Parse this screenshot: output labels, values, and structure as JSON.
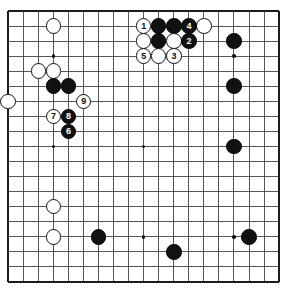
{
  "diagram": {
    "type": "go-board",
    "board_size": 19,
    "geometry": {
      "origin_x": 8.2,
      "origin_y": 11.0,
      "spacing": 15.05,
      "stone_diameter": 15.6,
      "hoshi_diameter": 3.6,
      "border_outer_width": 1.6,
      "line_width": 0.85
    },
    "colors": {
      "background": "#ffffff",
      "line": "#3a3a3a",
      "border": "#1b1b1b",
      "black_stone": "#111111",
      "white_stone": "#ffffff",
      "white_stone_edge": "#111111",
      "black_label": "#ffffff",
      "white_label": "#111111"
    },
    "hoshi_points": [
      [
        3,
        3
      ],
      [
        9,
        3
      ],
      [
        15,
        3
      ],
      [
        3,
        9
      ],
      [
        9,
        9
      ],
      [
        15,
        9
      ],
      [
        3,
        15
      ],
      [
        9,
        15
      ],
      [
        15,
        15
      ]
    ],
    "stones": [
      {
        "id": "w-c3-r1",
        "col": 3,
        "row": 1,
        "color": "white",
        "label": ""
      },
      {
        "id": "w-c2-r4",
        "col": 2,
        "row": 4,
        "color": "white",
        "label": ""
      },
      {
        "id": "w-c3-r4",
        "col": 3,
        "row": 4,
        "color": "white",
        "label": ""
      },
      {
        "id": "b-c3-r5",
        "col": 3,
        "row": 5,
        "color": "black",
        "label": ""
      },
      {
        "id": "b-c4-r5",
        "col": 4,
        "row": 5,
        "color": "black",
        "label": ""
      },
      {
        "id": "w-c0-r6",
        "col": 0,
        "row": 6,
        "color": "white",
        "label": ""
      },
      {
        "id": "w-c5-r6",
        "col": 5,
        "row": 6,
        "color": "white",
        "label": "9"
      },
      {
        "id": "w-c3-r7",
        "col": 3,
        "row": 7,
        "color": "white",
        "label": "7"
      },
      {
        "id": "b-c4-r7",
        "col": 4,
        "row": 7,
        "color": "black",
        "label": "8"
      },
      {
        "id": "b-c4-r8",
        "col": 4,
        "row": 8,
        "color": "black",
        "label": "6"
      },
      {
        "id": "w-c3-r13",
        "col": 3,
        "row": 13,
        "color": "white",
        "label": ""
      },
      {
        "id": "w-c3-r15",
        "col": 3,
        "row": 15,
        "color": "white",
        "label": ""
      },
      {
        "id": "b-c6-r15",
        "col": 6,
        "row": 15,
        "color": "black",
        "label": ""
      },
      {
        "id": "b-c11-r16",
        "col": 11,
        "row": 16,
        "color": "black",
        "label": ""
      },
      {
        "id": "b-c16-r15",
        "col": 16,
        "row": 15,
        "color": "black",
        "label": ""
      },
      {
        "id": "w-c9-r1",
        "col": 9,
        "row": 1,
        "color": "white",
        "label": "1"
      },
      {
        "id": "b-c10-r1",
        "col": 10,
        "row": 1,
        "color": "black",
        "label": ""
      },
      {
        "id": "b-c11-r1",
        "col": 11,
        "row": 1,
        "color": "black",
        "label": ""
      },
      {
        "id": "b-c12-r1",
        "col": 12,
        "row": 1,
        "color": "black",
        "label": "4"
      },
      {
        "id": "w-c13-r1",
        "col": 13,
        "row": 1,
        "color": "white",
        "label": ""
      },
      {
        "id": "w-c9-r2",
        "col": 9,
        "row": 2,
        "color": "white",
        "label": ""
      },
      {
        "id": "b-c10-r2",
        "col": 10,
        "row": 2,
        "color": "black",
        "label": ""
      },
      {
        "id": "w-c11-r2",
        "col": 11,
        "row": 2,
        "color": "white",
        "label": ""
      },
      {
        "id": "b-c12-r2",
        "col": 12,
        "row": 2,
        "color": "black",
        "label": "2"
      },
      {
        "id": "w-c9-r3",
        "col": 9,
        "row": 3,
        "color": "white",
        "label": "5"
      },
      {
        "id": "w-c10-r3",
        "col": 10,
        "row": 3,
        "color": "white",
        "label": ""
      },
      {
        "id": "w-c11-r3",
        "col": 11,
        "row": 3,
        "color": "white",
        "label": "3"
      },
      {
        "id": "b-c15-r2",
        "col": 15,
        "row": 2,
        "color": "black",
        "label": ""
      },
      {
        "id": "b-c15-r5",
        "col": 15,
        "row": 5,
        "color": "black",
        "label": ""
      },
      {
        "id": "b-c15-r9",
        "col": 15,
        "row": 9,
        "color": "black",
        "label": ""
      }
    ]
  }
}
